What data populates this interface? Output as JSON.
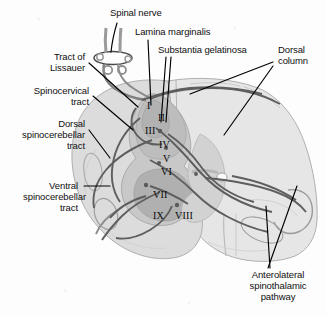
{
  "figure": {
    "labels": {
      "spinal_nerve": "Spinal nerve",
      "lamina_marginalis": "Lamina marginalis",
      "substantia_gelatinosa": "Substantia gelatinosa",
      "dorsal_column_l1": "Dorsal",
      "dorsal_column_l2": "column",
      "tract_of_lissauer_l1": "Tract of",
      "tract_of_lissauer_l2": "Lissauer",
      "spinocervical_l1": "Spinocervical",
      "spinocervical_l2": "tract",
      "dorsal_spinocerebellar_l1": "Dorsal",
      "dorsal_spinocerebellar_l2": "spinocerebellar",
      "dorsal_spinocerebellar_l3": "tract",
      "ventral_spinocerebellar_l1": "Ventral",
      "ventral_spinocerebellar_l2": "spinocerebellar",
      "ventral_spinocerebellar_l3": "tract",
      "anterolateral_l1": "Anterolateral",
      "anterolateral_l2": "spinothalamic",
      "anterolateral_l3": "pathway"
    },
    "laminae": {
      "i": "I",
      "ii": "II",
      "iii": "III",
      "iv": "IV",
      "v": "V",
      "vi": "VI",
      "vii": "VII",
      "viii": "VIII",
      "ix": "IX"
    },
    "colors": {
      "background": "#fdfdfd",
      "text": "#101010",
      "leader_line": "#000000",
      "white_matter": "#dcdcdc",
      "white_matter_right": "#e4e4e4",
      "gray_matter": "#c4c4c4",
      "gray_matter_dark": "#b0b0b0",
      "dorsal_horn_shade": "#bdbdbd",
      "fiber_tract": "#6a6a6a",
      "outline": "#9a9a9a"
    }
  }
}
